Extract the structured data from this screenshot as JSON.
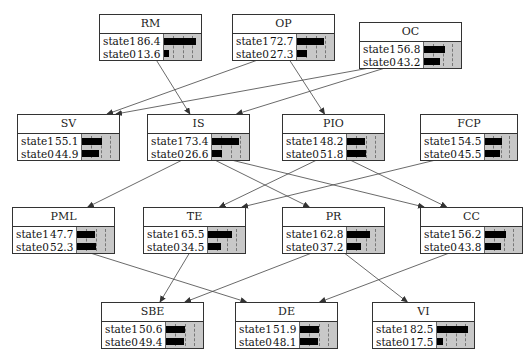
{
  "diagram": {
    "type": "bayesian-network",
    "nodes": [
      {
        "id": "RM",
        "title": "RM",
        "x": 99,
        "y": 14,
        "w": 103,
        "states": [
          {
            "label": "state1",
            "value": "86.4",
            "pct": 86.4
          },
          {
            "label": "state0",
            "value": "13.6",
            "pct": 13.6
          }
        ]
      },
      {
        "id": "OP",
        "title": "OP",
        "x": 232,
        "y": 14,
        "w": 103,
        "states": [
          {
            "label": "state1",
            "value": "72.7",
            "pct": 72.7
          },
          {
            "label": "state0",
            "value": "27.3",
            "pct": 27.3
          }
        ]
      },
      {
        "id": "OC",
        "title": "OC",
        "x": 359,
        "y": 22,
        "w": 103,
        "states": [
          {
            "label": "state1",
            "value": "56.8",
            "pct": 56.8
          },
          {
            "label": "state0",
            "value": "43.2",
            "pct": 43.2
          }
        ]
      },
      {
        "id": "SV",
        "title": "SV",
        "x": 17,
        "y": 114,
        "w": 103,
        "states": [
          {
            "label": "state1",
            "value": "55.1",
            "pct": 55.1
          },
          {
            "label": "state0",
            "value": "44.9",
            "pct": 44.9
          }
        ]
      },
      {
        "id": "IS",
        "title": "IS",
        "x": 147,
        "y": 114,
        "w": 103,
        "states": [
          {
            "label": "state1",
            "value": "73.4",
            "pct": 73.4
          },
          {
            "label": "state0",
            "value": "26.6",
            "pct": 26.6
          }
        ]
      },
      {
        "id": "PIO",
        "title": "PIO",
        "x": 282,
        "y": 114,
        "w": 103,
        "states": [
          {
            "label": "state1",
            "value": "48.2",
            "pct": 48.2
          },
          {
            "label": "state0",
            "value": "51.8",
            "pct": 51.8
          }
        ]
      },
      {
        "id": "FCP",
        "title": "FCP",
        "x": 420,
        "y": 114,
        "w": 98,
        "states": [
          {
            "label": "state1",
            "value": "54.5",
            "pct": 54.5
          },
          {
            "label": "state0",
            "value": "45.5",
            "pct": 45.5
          }
        ]
      },
      {
        "id": "PML",
        "title": "PML",
        "x": 12,
        "y": 207,
        "w": 103,
        "states": [
          {
            "label": "state1",
            "value": "47.7",
            "pct": 47.7
          },
          {
            "label": "state0",
            "value": "52.3",
            "pct": 52.3
          }
        ]
      },
      {
        "id": "TE",
        "title": "TE",
        "x": 143,
        "y": 207,
        "w": 103,
        "states": [
          {
            "label": "state1",
            "value": "65.5",
            "pct": 65.5
          },
          {
            "label": "state0",
            "value": "34.5",
            "pct": 34.5
          }
        ]
      },
      {
        "id": "PR",
        "title": "PR",
        "x": 282,
        "y": 207,
        "w": 103,
        "states": [
          {
            "label": "state1",
            "value": "62.8",
            "pct": 62.8
          },
          {
            "label": "state0",
            "value": "37.2",
            "pct": 37.2
          }
        ]
      },
      {
        "id": "CC",
        "title": "CC",
        "x": 420,
        "y": 207,
        "w": 103,
        "states": [
          {
            "label": "state1",
            "value": "56.2",
            "pct": 56.2
          },
          {
            "label": "state0",
            "value": "43.8",
            "pct": 43.8
          }
        ]
      },
      {
        "id": "SBE",
        "title": "SBE",
        "x": 101,
        "y": 302,
        "w": 103,
        "states": [
          {
            "label": "state1",
            "value": "50.6",
            "pct": 50.6
          },
          {
            "label": "state0",
            "value": "49.4",
            "pct": 49.4
          }
        ]
      },
      {
        "id": "DE",
        "title": "DE",
        "x": 235,
        "y": 302,
        "w": 103,
        "states": [
          {
            "label": "state1",
            "value": "51.9",
            "pct": 51.9
          },
          {
            "label": "state0",
            "value": "48.1",
            "pct": 48.1
          }
        ]
      },
      {
        "id": "VI",
        "title": "VI",
        "x": 372,
        "y": 302,
        "w": 103,
        "states": [
          {
            "label": "state1",
            "value": "82.5",
            "pct": 82.5
          },
          {
            "label": "state0",
            "value": "17.5",
            "pct": 17.5
          }
        ]
      }
    ],
    "edges": [
      {
        "from": "RM",
        "to": "IS"
      },
      {
        "from": "OP",
        "to": "SV"
      },
      {
        "from": "OP",
        "to": "PIO"
      },
      {
        "from": "OC",
        "to": "SV"
      },
      {
        "from": "OC",
        "to": "IS"
      },
      {
        "from": "IS",
        "to": "PML"
      },
      {
        "from": "IS",
        "to": "PR"
      },
      {
        "from": "IS",
        "to": "CC"
      },
      {
        "from": "PIO",
        "to": "TE"
      },
      {
        "from": "PIO",
        "to": "CC"
      },
      {
        "from": "FCP",
        "to": "TE"
      },
      {
        "from": "PML",
        "to": "DE"
      },
      {
        "from": "TE",
        "to": "SBE"
      },
      {
        "from": "PR",
        "to": "SBE"
      },
      {
        "from": "PR",
        "to": "VI"
      },
      {
        "from": "CC",
        "to": "DE"
      }
    ],
    "colors": {
      "border": "#333333",
      "bar": "#000000",
      "bar_bg": "#c8c8c8",
      "edge": "#444444"
    }
  }
}
